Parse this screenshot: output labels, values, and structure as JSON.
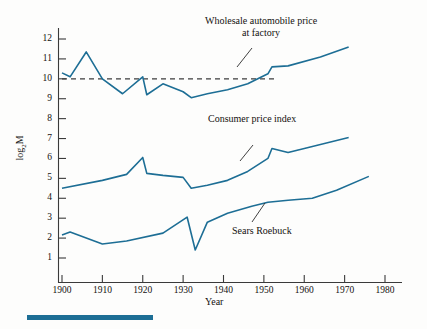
{
  "chart_data": {
    "type": "line",
    "title": "",
    "xlabel": "Year",
    "ylabel": "log2M",
    "ylabel_base": "log",
    "ylabel_sub": "2",
    "ylabel_tail": "M",
    "xlim": [
      1898,
      1982
    ],
    "ylim": [
      0.5,
      12.6
    ],
    "grid": false,
    "legend_position": "inline-annotations",
    "xticks": [
      1900,
      1910,
      1920,
      1930,
      1940,
      1950,
      1960,
      1970,
      1980
    ],
    "xtick_labels": [
      "1900",
      "1910",
      "1920",
      "1930",
      "1940",
      "1950",
      "1960",
      "1970",
      "1980"
    ],
    "yticks": [
      1,
      2,
      3,
      4,
      5,
      6,
      7,
      8,
      9,
      10,
      11,
      12
    ],
    "ytick_labels": [
      "1",
      "2",
      "3",
      "4",
      "5",
      "6",
      "7",
      "8",
      "9",
      "10",
      "11",
      "12"
    ],
    "reference_line": {
      "label": "",
      "y": 10,
      "style": "dashed",
      "x_start": 1900,
      "x_end": 1953,
      "color": "#3c3c3c"
    },
    "series": [
      {
        "name": "Wholesale automobile price at factory",
        "color": "#1d6e95",
        "x": [
          1900,
          1902,
          1906,
          1910,
          1915,
          1920,
          1921,
          1925,
          1930,
          1932,
          1936,
          1941,
          1946,
          1951,
          1952,
          1956,
          1964,
          1971
        ],
        "values": [
          10.3,
          10.1,
          11.35,
          10.0,
          9.25,
          10.1,
          9.2,
          9.75,
          9.35,
          9.05,
          9.25,
          9.45,
          9.75,
          10.25,
          10.6,
          10.65,
          11.1,
          11.6
        ]
      },
      {
        "name": "Consumer price index",
        "color": "#1d6e95",
        "x": [
          1900,
          1910,
          1916,
          1920,
          1921,
          1925,
          1930,
          1932,
          1936,
          1941,
          1946,
          1951,
          1952,
          1956,
          1964,
          1971
        ],
        "values": [
          4.5,
          4.9,
          5.2,
          6.05,
          5.25,
          5.15,
          5.05,
          4.5,
          4.65,
          4.9,
          5.35,
          6.0,
          6.5,
          6.3,
          6.7,
          7.05
        ]
      },
      {
        "name": "Sears Roebuck",
        "color": "#1d6e95",
        "x": [
          1900,
          1902,
          1910,
          1916,
          1925,
          1931,
          1933,
          1936,
          1941,
          1947,
          1951,
          1956,
          1962,
          1968,
          1976
        ],
        "values": [
          2.15,
          2.3,
          1.7,
          1.85,
          2.25,
          3.05,
          1.4,
          2.8,
          3.25,
          3.6,
          3.8,
          3.9,
          4.0,
          4.4,
          5.1
        ]
      }
    ],
    "annotations": [
      {
        "id": "wholesale",
        "lines": [
          "Wholesale automobile price",
          "at factory"
        ],
        "text": "Wholesale automobile price at factory",
        "leader_from": [
          252,
          48
        ],
        "leader_to": [
          237,
          67
        ]
      },
      {
        "id": "cpi",
        "lines": [
          "Consumer price index"
        ],
        "text": "Consumer price index",
        "leader_from": [
          253,
          145
        ],
        "leader_to": [
          240,
          161
        ]
      },
      {
        "id": "sears",
        "lines": [
          "Sears Roebuck"
        ],
        "text": "Sears Roebuck",
        "leader_from": [
          252,
          222
        ],
        "leader_to": [
          265,
          203
        ]
      }
    ]
  },
  "figure": {
    "accent_color": "#1d6e95",
    "axis_color": "#3a3a3a",
    "background": "#fdfdfc",
    "rule_bar_color": "#1d6e95"
  }
}
